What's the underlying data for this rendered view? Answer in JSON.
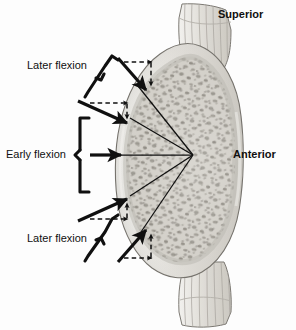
{
  "figure": {
    "background_color": "#fdfdfd",
    "ink_color": "#101010"
  },
  "orientation_labels": {
    "superior": "Superior",
    "anterior": "Anterior"
  },
  "annotations": {
    "later_flexion_top": "Later flexion",
    "early_flexion": "Early flexion",
    "later_flexion_bottom": "Later flexion"
  },
  "anatomy": {
    "endplate_superior_name": "superior-endplate",
    "endplate_inferior_name": "inferior-endplate",
    "body_name": "vertebral-body-trabecular",
    "cortex_name": "cortical-shell",
    "colors": {
      "cortex_light": "#e9e7e2",
      "cortex_mid": "#d4d1cb",
      "trabecular_fill": "#cfccc5",
      "trabecular_speckle": "#8d8981",
      "endplate_fill": "#e4e2dd",
      "endplate_stripe": "#b9b6af",
      "outline": "#6e6b66"
    }
  },
  "vectors": {
    "convergence_point": {
      "x": 193,
      "y": 155
    },
    "solid_count": 5,
    "dashed_component_pairs": 4,
    "items": [
      {
        "name": "force-vector-upper-outer",
        "style": "solid-thick",
        "direction": "down-right",
        "group": "later-flexion-top"
      },
      {
        "name": "force-vector-upper-inner",
        "style": "solid-thick",
        "direction": "down-right",
        "group": "later-flexion-top"
      },
      {
        "name": "force-vector-horizontal",
        "style": "solid-thick",
        "direction": "right",
        "group": "early-flexion"
      },
      {
        "name": "force-vector-lower-inner",
        "style": "solid-thick",
        "direction": "up-right",
        "group": "later-flexion-bottom"
      },
      {
        "name": "force-vector-lower-outer",
        "style": "solid-thick",
        "direction": "up-right",
        "group": "later-flexion-bottom"
      },
      {
        "name": "component-vector-upper-outer-horizontal",
        "style": "dashed",
        "direction": "right"
      },
      {
        "name": "component-vector-upper-outer-vertical",
        "style": "dashed",
        "direction": "down"
      },
      {
        "name": "component-vector-upper-inner-horizontal",
        "style": "dashed",
        "direction": "right"
      },
      {
        "name": "component-vector-upper-inner-vertical",
        "style": "dashed",
        "direction": "down"
      },
      {
        "name": "component-vector-lower-inner-horizontal",
        "style": "dashed",
        "direction": "right"
      },
      {
        "name": "component-vector-lower-inner-vertical",
        "style": "dashed",
        "direction": "up"
      },
      {
        "name": "component-vector-lower-outer-horizontal",
        "style": "dashed",
        "direction": "right"
      },
      {
        "name": "component-vector-lower-outer-vertical",
        "style": "dashed",
        "direction": "up"
      }
    ]
  },
  "brackets": [
    {
      "name": "bracket-later-flexion-top",
      "orientation": "diagonal-up-right"
    },
    {
      "name": "bracket-early-flexion",
      "orientation": "vertical-curly"
    },
    {
      "name": "bracket-later-flexion-bottom",
      "orientation": "diagonal-down-right"
    }
  ]
}
